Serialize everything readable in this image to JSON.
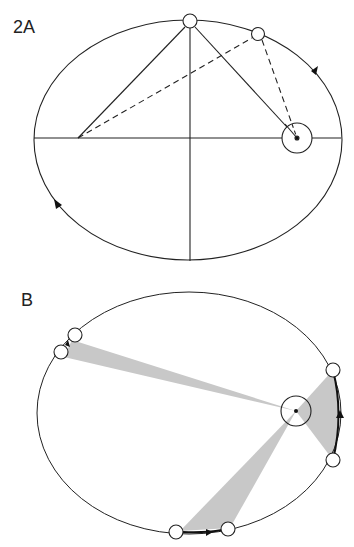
{
  "figure": {
    "panel_a": {
      "label": "2A",
      "description": "Elliptical orbit with major and minor axes, sun at one focus, planet positions showing sum of distances to foci",
      "ellipse": {
        "cx": 190,
        "cy": 140,
        "rx": 156,
        "ry": 120
      },
      "sun": {
        "x": 297,
        "y": 138,
        "r": 14
      },
      "empty_focus": {
        "x": 78,
        "y": 138
      },
      "planets": [
        {
          "x": 190,
          "y": 21
        },
        {
          "x": 258,
          "y": 34
        }
      ],
      "direction_arrows": [
        "counterclockwise"
      ]
    },
    "panel_b": {
      "label": "B",
      "description": "Kepler's second law: equal areas swept in equal times, three shaded sectors from sun",
      "ellipse": {
        "cx": 189,
        "cy": 413,
        "rx": 152,
        "ry": 121
      },
      "sun": {
        "x": 296,
        "y": 411,
        "r": 15
      },
      "sectors": [
        {
          "from": {
            "x": 75,
            "y": 335
          },
          "to": {
            "x": 61,
            "y": 352
          }
        },
        {
          "from": {
            "x": 333,
            "y": 370
          },
          "to": {
            "x": 333,
            "y": 460
          }
        },
        {
          "from": {
            "x": 176,
            "y": 532
          },
          "to": {
            "x": 228,
            "y": 529
          }
        }
      ],
      "sector_color": "#c8c8c8"
    },
    "colors": {
      "stroke": "#222222",
      "shade": "#c8c8c8",
      "background": "#ffffff"
    }
  }
}
